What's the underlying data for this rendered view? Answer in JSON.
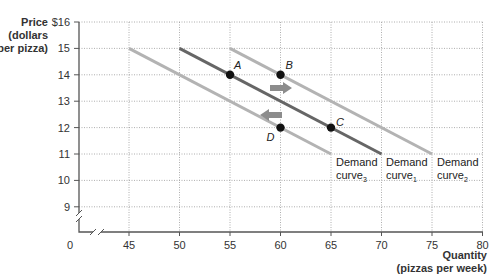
{
  "chart_data": {
    "type": "line",
    "title": "",
    "ylabel": [
      "Price",
      "(dollars",
      "per pizza)"
    ],
    "xlabel": [
      "Quantity",
      "(pizzas per week)"
    ],
    "xlim": [
      45,
      80
    ],
    "ylim": [
      9,
      16
    ],
    "x_ticks": [
      "0",
      "45",
      "50",
      "55",
      "60",
      "65",
      "70",
      "75",
      "80"
    ],
    "y_ticks": [
      "$16",
      "15",
      "14",
      "13",
      "12",
      "11",
      "10",
      "9"
    ],
    "grid": true,
    "series": [
      {
        "name": "Demand curve3",
        "color": "#b3b3b3",
        "points": [
          [
            45,
            15
          ],
          [
            65,
            11
          ]
        ]
      },
      {
        "name": "Demand curve1",
        "color": "#666666",
        "points": [
          [
            50,
            15
          ],
          [
            70,
            11
          ]
        ]
      },
      {
        "name": "Demand curve2",
        "color": "#b3b3b3",
        "points": [
          [
            55,
            15
          ],
          [
            75,
            11
          ]
        ]
      }
    ],
    "points": [
      {
        "label": "A",
        "x": 55,
        "y": 14
      },
      {
        "label": "B",
        "x": 60,
        "y": 14
      },
      {
        "label": "C",
        "x": 65,
        "y": 12
      },
      {
        "label": "D",
        "x": 60,
        "y": 12
      }
    ],
    "annotations": [
      {
        "type": "arrow",
        "direction": "right",
        "x": 62,
        "y": 13.5,
        "meaning": "demand shift to curve2"
      },
      {
        "type": "arrow",
        "direction": "left",
        "x": 60,
        "y": 12.5,
        "meaning": "demand shift to curve3"
      }
    ],
    "curve_labels": [
      {
        "text": "Demand",
        "sub": "curve",
        "idx": "3"
      },
      {
        "text": "Demand",
        "sub": "curve",
        "idx": "1"
      },
      {
        "text": "Demand",
        "sub": "curve",
        "idx": "2"
      }
    ]
  }
}
